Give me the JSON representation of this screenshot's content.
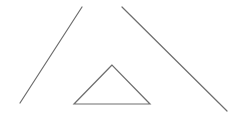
{
  "diagram": {
    "width": 245,
    "height": 128,
    "background": "#ffffff",
    "stroke_color": "#6e6e6e",
    "stroke_width": 1.2,
    "shapes": [
      {
        "type": "line",
        "name": "left-line",
        "x1": 82,
        "y1": 7,
        "x2": 20,
        "y2": 103
      },
      {
        "type": "line",
        "name": "right-line",
        "x1": 122,
        "y1": 7,
        "x2": 227,
        "y2": 111
      },
      {
        "type": "triangle",
        "name": "small-triangle",
        "points": [
          [
            112,
            65
          ],
          [
            74,
            104
          ],
          [
            150,
            104
          ]
        ]
      }
    ]
  }
}
